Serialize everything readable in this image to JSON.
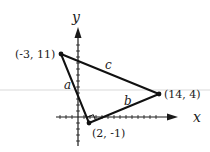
{
  "diagram": {
    "type": "coordinate-plane-triangle",
    "axes": {
      "x_label": "x",
      "y_label": "y",
      "axis_color": "#1a1a1a"
    },
    "vertices": [
      {
        "id": "A",
        "label": "(-3, 11)",
        "x": -3,
        "y": 11
      },
      {
        "id": "B",
        "label": "(14, 4)",
        "x": 14,
        "y": 4
      },
      {
        "id": "C",
        "label": "(2, -1)",
        "x": 2,
        "y": -1
      }
    ],
    "sides": [
      {
        "name": "a",
        "from": "A",
        "to": "C",
        "label": "a"
      },
      {
        "name": "b",
        "from": "C",
        "to": "B",
        "label": "b"
      },
      {
        "name": "c",
        "from": "A",
        "to": "B",
        "label": "c"
      }
    ],
    "right_angle_at": "C",
    "colors": {
      "line": "#111111",
      "background": "#ffffff",
      "faint_rule": "#d6d6d6"
    }
  }
}
